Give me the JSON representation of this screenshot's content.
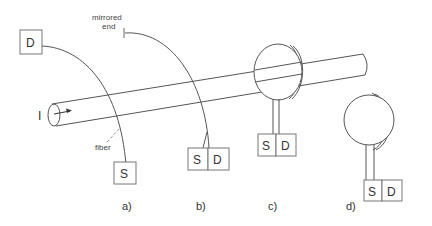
{
  "diagram": {
    "current_label": "I",
    "fiber_label": "fiber",
    "mirrored_end_label_line1": "mirrored",
    "mirrored_end_label_line2": "end",
    "source_label": "S",
    "detector_label": "D",
    "panels": [
      {
        "id": "a",
        "caption": "a)",
        "description": "fiber wrapped across conductor, source and detector separate"
      },
      {
        "id": "b",
        "caption": "b)",
        "description": "fiber with mirrored end, source and detector combined"
      },
      {
        "id": "c",
        "caption": "c)",
        "description": "coiled fiber around conductor with S|D module"
      },
      {
        "id": "d",
        "caption": "d)",
        "description": "standalone fiber coil with S|D module"
      }
    ]
  }
}
